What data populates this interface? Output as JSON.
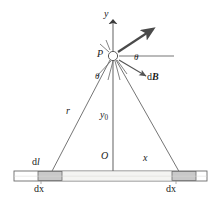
{
  "figure": {
    "axis": {
      "y_axis_label": "y",
      "origin_label": "O"
    },
    "point": {
      "label": "P"
    },
    "labels": {
      "angle_right": "θ",
      "angle_left": "θ",
      "field_vector_d": "d",
      "field_vector_B": "B",
      "radius": "r",
      "height": "y",
      "height_subscript": "0",
      "horizontal_distance": "x",
      "current_element_d": "d",
      "current_element_l": "l",
      "dx_left": "dx",
      "dx_right": "dx"
    },
    "colors": {
      "line": "#555555",
      "text": "#1a1a1a",
      "bar_fill": "#ffffff",
      "bar_mid_fill": "#f4f4f2",
      "bar_segment_fill": "#c9c9c9",
      "bar_stroke": "#6b6b6b",
      "arrow_thick": "#4a4a4a"
    },
    "geometry": {
      "point_P": [
        113,
        56
      ],
      "origin_O": [
        113,
        172
      ],
      "bar_left": 14,
      "bar_right": 207,
      "bar_top": 171,
      "bar_bottom": 181,
      "segment_left": [
        38,
        62
      ],
      "segment_right": [
        172,
        196
      ]
    }
  }
}
